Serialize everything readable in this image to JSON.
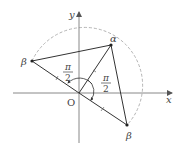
{
  "diagram": {
    "axes": {
      "x_label": "x",
      "y_label": "y",
      "origin_label": "O"
    },
    "points": [
      {
        "name": "alpha",
        "label": "α",
        "x": 111,
        "y": 45
      },
      {
        "name": "beta-left",
        "label": "β",
        "x": 32,
        "y": 61
      },
      {
        "name": "beta-right",
        "label": "β",
        "x": 127,
        "y": 125
      }
    ],
    "angles": [
      {
        "name": "angle-left",
        "numerator": "π",
        "denominator": "2"
      },
      {
        "name": "angle-right",
        "numerator": "π",
        "denominator": "2"
      }
    ],
    "colors": {
      "line": "#333333",
      "axis": "#888888",
      "dashed": "#aaaaaa"
    }
  }
}
